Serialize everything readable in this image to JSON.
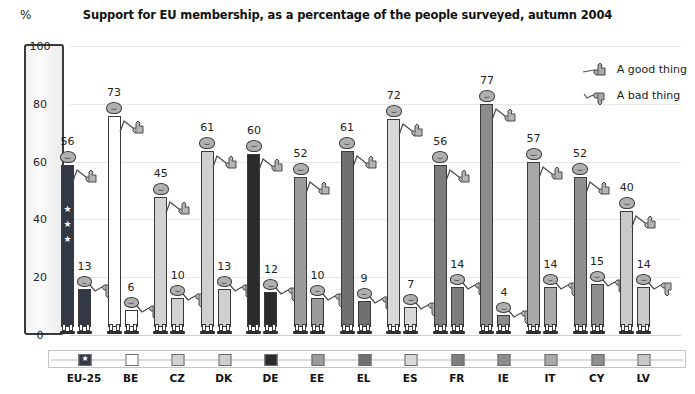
{
  "chart_data": {
    "type": "bar",
    "title": "Support for EU membership, as a percentage of the people surveyed, autumn 2004",
    "xlabel": "",
    "ylabel": "%",
    "ylim": [
      0,
      100
    ],
    "yticks": [
      0,
      20,
      40,
      60,
      80,
      100
    ],
    "grid": true,
    "legend_position": "top-right",
    "categories": [
      "EU-25",
      "BE",
      "CZ",
      "DK",
      "DE",
      "EE",
      "EL",
      "ES",
      "FR",
      "IE",
      "IT",
      "CY",
      "LV"
    ],
    "series": [
      {
        "name": "A good thing",
        "values": [
          56,
          73,
          45,
          61,
          60,
          52,
          61,
          72,
          56,
          77,
          57,
          52,
          40
        ]
      },
      {
        "name": "A bad thing",
        "values": [
          13,
          6,
          10,
          13,
          12,
          10,
          9,
          7,
          14,
          4,
          14,
          15,
          14
        ]
      }
    ],
    "colors": [
      "#333845",
      "#ffffff",
      "#d2d2d2",
      "#cfcfcf",
      "#2b2b2b",
      "#9b9b9b",
      "#707070",
      "#d8d8d8",
      "#7d7d7d",
      "#8c8c8c",
      "#a8a8a8",
      "#8f8f8f",
      "#c9c9c9"
    ]
  },
  "header": {
    "title": "Support for EU membership, as a percentage of the people surveyed, autumn 2004",
    "percent_symbol": "%"
  },
  "yaxis": {
    "ticks": [
      "100",
      "80",
      "60",
      "40",
      "20",
      "0"
    ]
  },
  "legend": {
    "items": [
      {
        "label": "A good thing",
        "icon": "thumbs-up-icon"
      },
      {
        "label": "A bad thing",
        "icon": "thumbs-down-icon"
      }
    ]
  },
  "countries": [
    {
      "code": "EU-25",
      "good": 56,
      "bad": 13,
      "color": "#333845",
      "stars": true
    },
    {
      "code": "BE",
      "good": 73,
      "bad": 6,
      "color": "#ffffff",
      "stars": false
    },
    {
      "code": "CZ",
      "good": 45,
      "bad": 10,
      "color": "#d2d2d2",
      "stars": false
    },
    {
      "code": "DK",
      "good": 61,
      "bad": 13,
      "color": "#cfcfcf",
      "stars": false
    },
    {
      "code": "DE",
      "good": 60,
      "bad": 12,
      "color": "#2b2b2b",
      "stars": false
    },
    {
      "code": "EE",
      "good": 52,
      "bad": 10,
      "color": "#9b9b9b",
      "stars": false
    },
    {
      "code": "EL",
      "good": 61,
      "bad": 9,
      "color": "#707070",
      "stars": false
    },
    {
      "code": "ES",
      "good": 72,
      "bad": 7,
      "color": "#d8d8d8",
      "stars": false
    },
    {
      "code": "FR",
      "good": 56,
      "bad": 14,
      "color": "#7d7d7d",
      "stars": false
    },
    {
      "code": "IE",
      "good": 77,
      "bad": 4,
      "color": "#8c8c8c",
      "stars": false
    },
    {
      "code": "IT",
      "good": 57,
      "bad": 14,
      "color": "#a8a8a8",
      "stars": false
    },
    {
      "code": "CY",
      "good": 52,
      "bad": 15,
      "color": "#8f8f8f",
      "stars": false
    },
    {
      "code": "LV",
      "good": 40,
      "bad": 14,
      "color": "#c9c9c9",
      "stars": false
    }
  ]
}
